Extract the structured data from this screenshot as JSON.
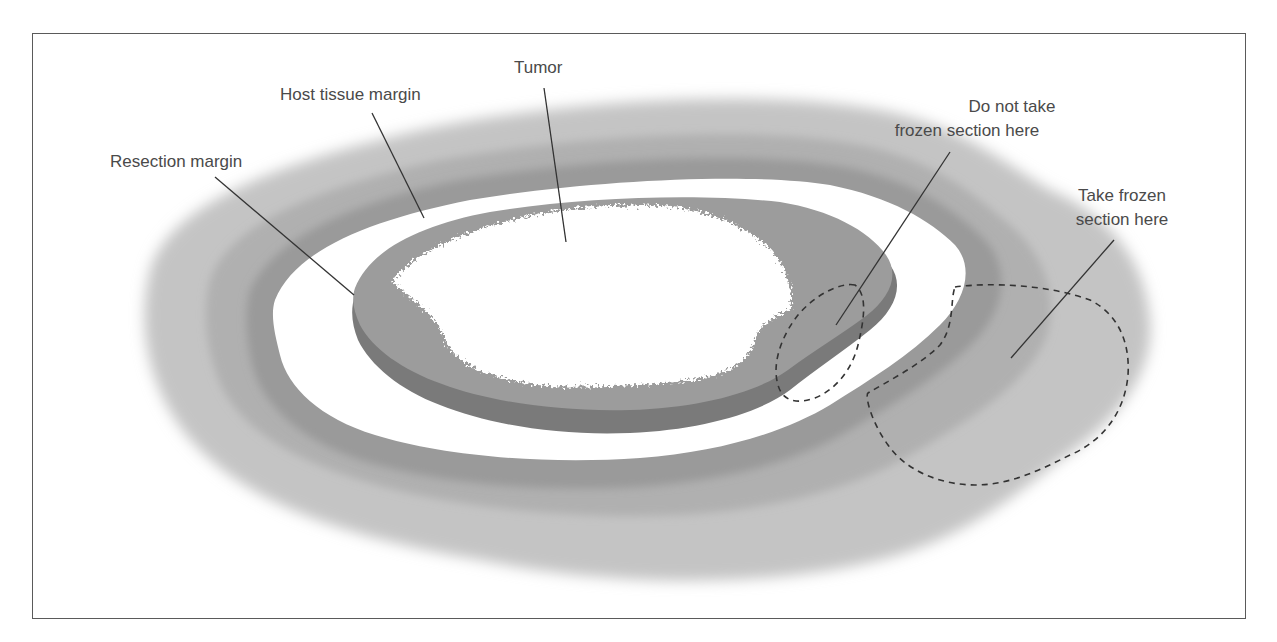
{
  "figure": {
    "labels": {
      "tumor": "Tumor",
      "host_tissue_margin": "Host tissue margin",
      "resection_margin": "Resection margin",
      "do_not_take_line1": "Do not take",
      "do_not_take_line2": "frozen section here",
      "take_line1": "Take frozen",
      "take_line2": "section here"
    },
    "colors": {
      "frame": "#5a5a5a",
      "host_tissue_outer": "#c2c2c2",
      "host_tissue_band": "#a8a8a8",
      "margin_white": "#ffffff",
      "resection_dark": "#7c7c7c",
      "resection_top": "#9e9e9e",
      "tumor": "#ffffff",
      "leader_line": "#333333",
      "dashed_outline": "#333333"
    }
  }
}
